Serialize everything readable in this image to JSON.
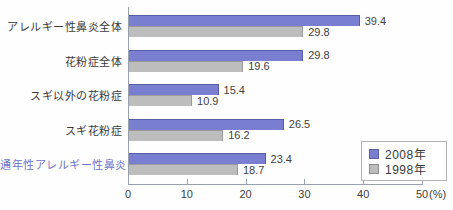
{
  "chart_data": {
    "type": "bar",
    "orientation": "horizontal",
    "title": "",
    "categories": [
      "アレルギー性鼻炎全体",
      "花粉症全体",
      "スギ以外の花粉症",
      "スギ花粉症",
      "通年性アレルギー性鼻炎"
    ],
    "series": [
      {
        "name": "2008年",
        "color": "#7a7ed1",
        "values": [
          39.4,
          29.8,
          15.4,
          26.5,
          23.4
        ]
      },
      {
        "name": "1998年",
        "color": "#bdbdbd",
        "values": [
          29.8,
          19.6,
          10.9,
          16.2,
          18.7
        ]
      }
    ],
    "xlabel": "(%)",
    "xlim": [
      0,
      50
    ],
    "xticks": [
      0,
      10,
      20,
      30,
      40,
      50
    ],
    "grid": false,
    "legend_position": "bottom-right",
    "highlight_category_index": 4,
    "highlight_color": "#6d74c8"
  },
  "axis": {
    "unit_label": "(%)"
  },
  "colors": {
    "axis_line": "#98a0ae",
    "tick_text": "#3f3f3f",
    "category_text": "#3a3a3a"
  }
}
